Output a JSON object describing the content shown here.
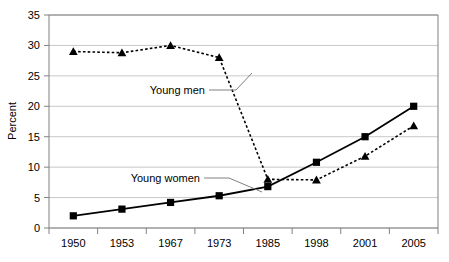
{
  "chart_data": {
    "type": "line",
    "title": "",
    "xlabel": "",
    "ylabel": "Percent",
    "categories": [
      "1950",
      "1953",
      "1967",
      "1973",
      "1985",
      "1998",
      "2001",
      "2005"
    ],
    "ylim": [
      0,
      35
    ],
    "yticks": [
      "0",
      "5",
      "10",
      "15",
      "20",
      "25",
      "30",
      "35"
    ],
    "grid": "horizontal",
    "legend_position": "inline-annotations",
    "series": [
      {
        "name": "Young men",
        "marker": "triangle",
        "line_style": "dashed",
        "color": "#000000",
        "values": [
          29,
          28.8,
          30,
          28,
          8,
          7.9,
          11.8,
          16.8
        ]
      },
      {
        "name": "Young women",
        "marker": "square",
        "line_style": "solid",
        "color": "#000000",
        "values": [
          2,
          3.1,
          4.2,
          5.3,
          6.8,
          10.8,
          15,
          20
        ]
      }
    ],
    "annotations": [
      {
        "text": "Young men",
        "series": "Young men"
      },
      {
        "text": "Young women",
        "series": "Young women"
      }
    ]
  },
  "style": {
    "gridline_color": "#c8c8c8",
    "axis_color": "#808080",
    "plot_background": "#ffffff",
    "series_color": "#000000",
    "leader_line_color": "#808080"
  }
}
